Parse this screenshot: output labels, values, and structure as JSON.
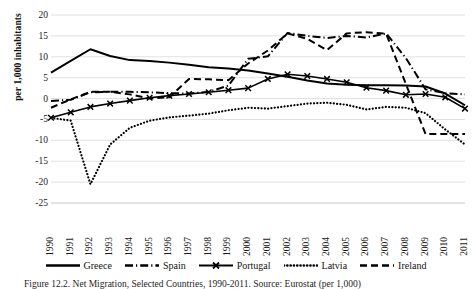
{
  "chart_data": {
    "type": "line",
    "title": "",
    "xlabel": "",
    "ylabel": "per 1,000 inhabitants",
    "ylim": [
      -25,
      20
    ],
    "yticks": [
      20,
      15,
      10,
      5,
      0,
      -5,
      -10,
      -15,
      -20,
      -25
    ],
    "grid": true,
    "legend_position": "bottom",
    "x": [
      1990,
      1991,
      1992,
      1993,
      1994,
      1995,
      1996,
      1997,
      1998,
      1999,
      2000,
      2001,
      2002,
      2003,
      2004,
      2005,
      2006,
      2007,
      2008,
      2009,
      2010,
      2011
    ],
    "categories": [
      "1990",
      "1991",
      "1992",
      "1993",
      "1994",
      "1995",
      "1996",
      "1997",
      "1998",
      "1999",
      "2000",
      "2001",
      "2002",
      "2003",
      "2004",
      "2005",
      "2006",
      "2007",
      "2008",
      "2009",
      "2010",
      "2011"
    ],
    "series": [
      {
        "name": "Greece",
        "style": "solid",
        "values": [
          6.2,
          9.0,
          11.8,
          10.2,
          9.2,
          9.0,
          8.6,
          8.1,
          7.5,
          7.2,
          6.7,
          6.0,
          5.2,
          4.3,
          3.6,
          3.3,
          3.2,
          3.2,
          3.1,
          2.9,
          1.2,
          -1.6
        ]
      },
      {
        "name": "Spain",
        "style": "dash-dot",
        "values": [
          -0.6,
          -0.3,
          1.5,
          1.6,
          1.6,
          1.5,
          1.3,
          1.2,
          1.6,
          3.1,
          9.5,
          10.1,
          15.7,
          15.0,
          14.5,
          15.0,
          14.6,
          15.6,
          9.7,
          2.2,
          1.3,
          1.0
        ]
      },
      {
        "name": "Portugal",
        "style": "x-marker",
        "values": [
          -4.6,
          -3.3,
          -2.0,
          -1.2,
          -0.5,
          0.2,
          0.7,
          1.1,
          1.5,
          2.0,
          2.5,
          4.7,
          5.8,
          5.4,
          4.7,
          3.9,
          2.6,
          1.9,
          0.9,
          1.1,
          0.3,
          -2.4
        ]
      },
      {
        "name": "Latvia",
        "style": "dotted",
        "values": [
          -4.6,
          -5.3,
          -20.5,
          -11.0,
          -7.0,
          -5.3,
          -4.5,
          -4.1,
          -3.6,
          -2.8,
          -2.2,
          -2.4,
          -1.8,
          -1.2,
          -1.0,
          -1.5,
          -2.6,
          -2.0,
          -2.2,
          -3.5,
          -7.4,
          -11.0
        ]
      },
      {
        "name": "Ireland",
        "style": "dashed",
        "values": [
          -2.2,
          -0.2,
          1.6,
          1.6,
          1.0,
          0.0,
          0.3,
          4.7,
          4.6,
          4.4,
          8.4,
          11.5,
          15.6,
          14.3,
          11.6,
          15.6,
          15.9,
          15.5,
          3.5,
          -8.5,
          -8.5,
          -8.5
        ]
      }
    ]
  },
  "legend": {
    "items": [
      {
        "label": "Greece",
        "key": "solid-line-key"
      },
      {
        "label": "Spain",
        "key": "dash-dot-line-key"
      },
      {
        "label": "Portugal",
        "key": "x-marker-line-key"
      },
      {
        "label": "Latvia",
        "key": "dotted-line-key"
      },
      {
        "label": "Ireland",
        "key": "dashed-line-key"
      }
    ]
  },
  "caption": {
    "text": "Figure 12.2. Net Migration, Selected Countries, 1990-2011. Source: Eurostat (per 1,000)"
  },
  "colors": {
    "series": "#000000",
    "grid": "#d9d9d9",
    "text": "#1a1a1a",
    "background": "#ffffff"
  }
}
